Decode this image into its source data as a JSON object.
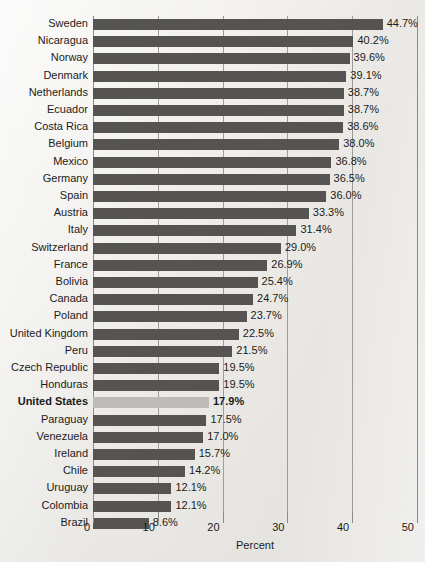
{
  "chart_data": {
    "type": "bar",
    "orientation": "horizontal",
    "title": "",
    "subtitle": "",
    "xlabel": "Percent",
    "ylabel": "",
    "xlim": [
      0,
      50
    ],
    "xticks": [
      0,
      10,
      20,
      30,
      40,
      50
    ],
    "xtick_labels": [
      "0",
      "10",
      "20",
      "30",
      "40",
      "50"
    ],
    "grid": "vertical",
    "legend": "none",
    "value_suffix": "%",
    "highlight_category": "United States",
    "colors": {
      "bar": "#555452",
      "bar_highlight": "#bcbbb8",
      "gridline": "#9d9c98",
      "background": "#f2f1ef",
      "text": "#1b1b1b"
    },
    "categories": [
      "Sweden",
      "Nicaragua",
      "Norway",
      "Denmark",
      "Netherlands",
      "Ecuador",
      "Costa Rica",
      "Belgium",
      "Mexico",
      "Germany",
      "Spain",
      "Austria",
      "Italy",
      "Switzerland",
      "France",
      "Bolivia",
      "Canada",
      "Poland",
      "United Kingdom",
      "Peru",
      "Czech Republic",
      "Honduras",
      "United States",
      "Paraguay",
      "Venezuela",
      "Ireland",
      "Chile",
      "Uruguay",
      "Colombia",
      "Brazil"
    ],
    "values": [
      44.7,
      40.2,
      39.6,
      39.1,
      38.7,
      38.7,
      38.6,
      38.0,
      36.8,
      36.5,
      36.0,
      33.3,
      31.4,
      29.0,
      26.9,
      25.4,
      24.7,
      23.7,
      22.5,
      21.5,
      19.5,
      19.5,
      17.9,
      17.5,
      17.0,
      15.7,
      14.2,
      12.1,
      12.1,
      8.6
    ],
    "value_labels": [
      "44.7%",
      "40.2%",
      "39.6%",
      "39.1%",
      "38.7%",
      "38.7%",
      "38.6%",
      "38.0%",
      "36.8%",
      "36.5%",
      "36.0%",
      "33.3%",
      "31.4%",
      "29.0%",
      "26.9%",
      "25.4%",
      "24.7%",
      "23.7%",
      "22.5%",
      "21.5%",
      "19.5%",
      "19.5%",
      "17.9%",
      "17.5%",
      "17.0%",
      "15.7%",
      "14.2%",
      "12.1%",
      "12.1%",
      "8.6%"
    ]
  }
}
